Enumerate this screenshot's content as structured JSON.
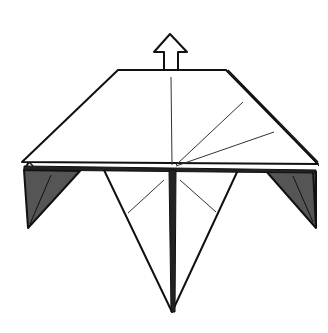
{
  "diagram": {
    "type": "origami-step",
    "background": "#ffffff",
    "colors": {
      "line": "#111111",
      "crease": "#333333",
      "shade": "#555555",
      "paper": "#ffffff"
    },
    "arrow": {
      "symbol": "push-up-arrow",
      "direction": "up"
    },
    "elements": [
      "top-trapezoid-flap",
      "left-dark-flap",
      "right-dark-flap",
      "lower-kite-point",
      "center-thick-fold",
      "radial-crease-lines",
      "up-arrow"
    ]
  }
}
